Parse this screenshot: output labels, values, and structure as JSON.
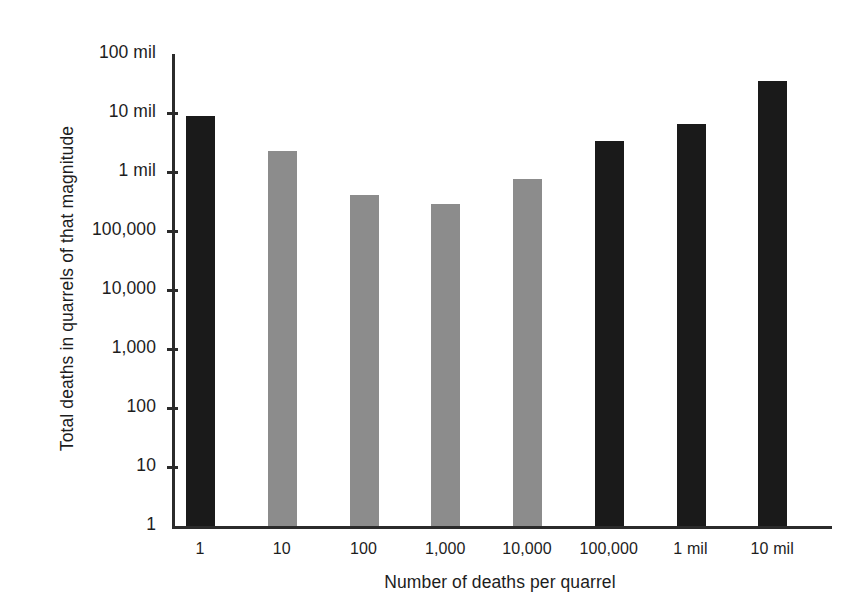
{
  "chart_data": {
    "type": "bar",
    "title": "",
    "xlabel": "Number of deaths per quarrel",
    "ylabel": "Total deaths in quarrels of that magnitude",
    "categories": [
      "1",
      "10",
      "100",
      "1,000",
      "10,000",
      "100,000",
      "1 mil",
      "10 mil"
    ],
    "values": [
      9000000,
      2300000,
      400000,
      290000,
      750000,
      3300000,
      6500000,
      35000000
    ],
    "value_labels": [
      "9 mil",
      "2.3 mil",
      "400,000",
      "290,000",
      "750,000",
      "3.3 mil",
      "6.5 mil",
      "35 mil"
    ],
    "bar_colors": [
      "#1a1a1a",
      "#8c8c8c",
      "#8c8c8c",
      "#8c8c8c",
      "#8c8c8c",
      "#1a1a1a",
      "#1a1a1a",
      "#1a1a1a"
    ],
    "yscale": "log",
    "ylim": [
      1,
      100000000
    ],
    "yticks": [
      1,
      10,
      100,
      1000,
      10000,
      100000,
      1000000,
      10000000,
      100000000
    ],
    "ytick_labels": [
      "1",
      "10",
      "100",
      "1,000",
      "10,000",
      "100,000",
      "1 mil",
      "10 mil",
      "100 mil"
    ],
    "grid": false,
    "legend": "none"
  }
}
